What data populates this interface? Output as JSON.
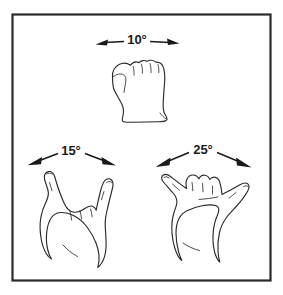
{
  "figure": {
    "background_color": "#ffffff",
    "ink_color": "#2b2b2b",
    "frame": {
      "name": "diagram-border",
      "x": 12,
      "y": 14,
      "width": 259,
      "height": 267,
      "stroke_color": "#2a2a2a"
    }
  },
  "measurements": [
    {
      "id": "top",
      "label": "10°",
      "value": 10,
      "unit": "degrees",
      "gesture": "closed-fist",
      "arrow_style": "double-headed-horizontal",
      "label_x": 137,
      "label_y": 41,
      "left_tip_x": 96,
      "left_tip_y": 44,
      "right_tip_x": 179,
      "right_tip_y": 43
    },
    {
      "id": "lower-left",
      "label": "15°",
      "value": 15,
      "unit": "degrees",
      "gesture": "horns-sign",
      "arrow_style": "double-headed-splayed",
      "label_x": 71,
      "label_y": 153,
      "left_tip_x": 28,
      "left_tip_y": 166,
      "right_tip_x": 116,
      "right_tip_y": 166
    },
    {
      "id": "lower-right",
      "label": "25°",
      "value": 25,
      "unit": "degrees",
      "gesture": "shaka-sign",
      "arrow_style": "double-headed-splayed",
      "label_x": 203,
      "label_y": 152,
      "left_tip_x": 156,
      "left_tip_y": 168,
      "right_tip_x": 252,
      "right_tip_y": 168
    }
  ],
  "hands": [
    {
      "id": "closed-fist",
      "name": "fist-top",
      "description": "Closed fist, knuckles up, thumb folded at left, wrist at bottom"
    },
    {
      "id": "horns-sign",
      "name": "hand-lower-left",
      "description": "Index and little finger extended upward, middle and ring folded"
    },
    {
      "id": "shaka-sign",
      "name": "hand-lower-right",
      "description": "Thumb and little finger extended outward, three middle fingers folded"
    }
  ]
}
